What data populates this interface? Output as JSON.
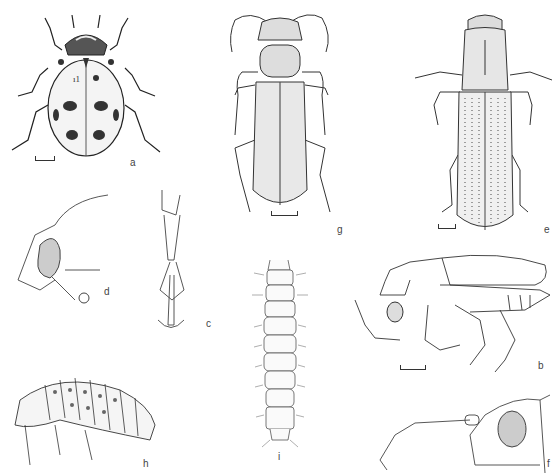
{
  "figure": {
    "type": "scientific illustration plate",
    "panels": [
      {
        "id": "a",
        "label": "a",
        "content": "ladybird beetle, dorsal view, spotted elytra",
        "scale_bar": true
      },
      {
        "id": "b",
        "label": "b",
        "content": "elongate beetle, lateral view",
        "scale_bar": true
      },
      {
        "id": "c",
        "label": "c",
        "content": "tarsus / leg segment with claws",
        "scale_bar": false
      },
      {
        "id": "d",
        "label": "d",
        "content": "head, lateral view with eye and antenna",
        "scale_bar": false
      },
      {
        "id": "e",
        "label": "e",
        "content": "slender beetle with striate-punctate elytra, dorsal view",
        "scale_bar": true
      },
      {
        "id": "f",
        "label": "f",
        "content": "head with antenna, lateral view",
        "scale_bar": false
      },
      {
        "id": "g",
        "label": "g",
        "content": "elongate beetle, dorsal view",
        "scale_bar": true
      },
      {
        "id": "h",
        "label": "h",
        "content": "larva, lateral view, tuberculate",
        "scale_bar": false
      },
      {
        "id": "i",
        "label": "i",
        "content": "campodeiform larva, dorsal view, setose",
        "scale_bar": false
      }
    ]
  }
}
